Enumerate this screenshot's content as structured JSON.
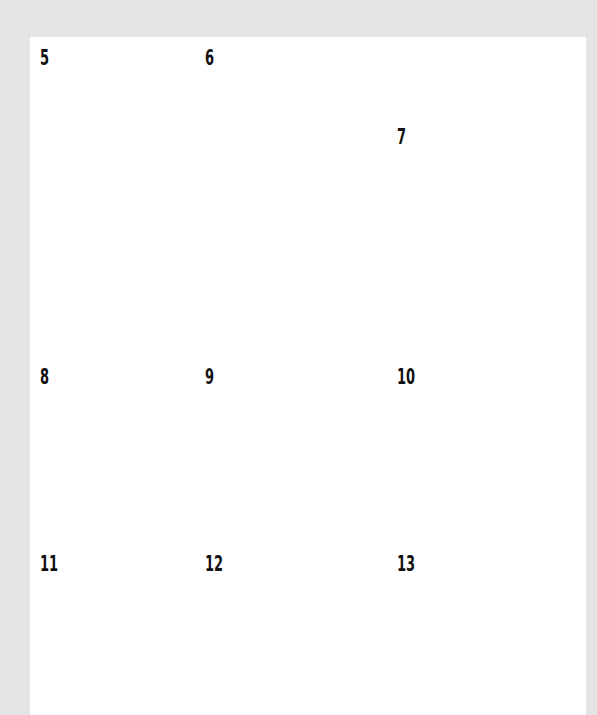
{
  "page": {
    "type": "building-instructions",
    "background_color": "#e4e4e4",
    "card_color": "#ffffff"
  },
  "steps": [
    {
      "number": "5",
      "illustration": "lighthouse-tower-with-antenna"
    },
    {
      "number": "6",
      "illustration": "lighthouse-tower-with-white-top"
    },
    {
      "number": "7",
      "illustration": "boat-hull-white"
    },
    {
      "number": "8",
      "illustration": "boat-hull-white"
    },
    {
      "number": "9",
      "illustration": "boat-hull-white"
    },
    {
      "number": "10",
      "illustration": "boat-hull-gray-deck"
    },
    {
      "number": "11",
      "illustration": "boat-hull-gray-deck-with-detail"
    },
    {
      "number": "12",
      "illustration": "boat-black-top"
    },
    {
      "number": "13",
      "illustration": "boat-black-top-with-detail"
    }
  ],
  "colors": {
    "black_brick": "#111111",
    "white_brick": "#fafafa",
    "gray_plate": "#888888",
    "dark_gray_plate": "#6a6a6a",
    "outline": "#9a9a9a"
  }
}
